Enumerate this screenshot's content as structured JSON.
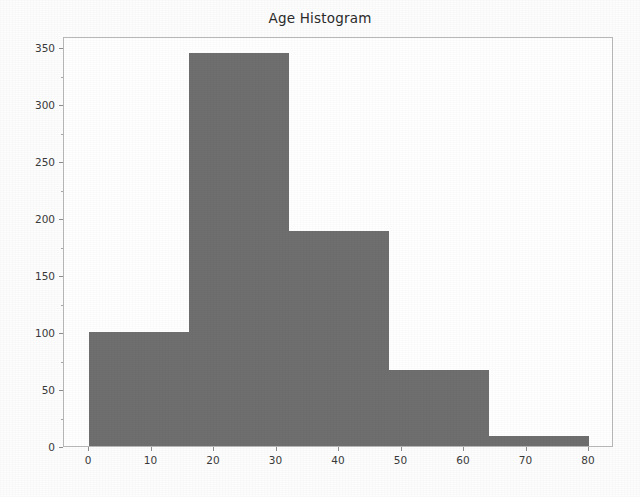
{
  "chart_data": {
    "type": "bar",
    "title": "Age Histogram",
    "xlabel": "",
    "ylabel": "",
    "grid": false,
    "legend": false,
    "bin_edges": [
      0,
      16,
      32,
      48,
      64,
      80
    ],
    "categories": [
      "0-16",
      "16-32",
      "32-48",
      "48-64",
      "64-80"
    ],
    "values": [
      100,
      345,
      189,
      67,
      9
    ],
    "bar_color": "#6f6f6f",
    "xlim": [
      -4,
      84
    ],
    "ylim": [
      0,
      360
    ],
    "xticks": [
      0,
      10,
      20,
      30,
      40,
      50,
      60,
      70,
      80
    ],
    "xtick_labels": [
      "0",
      "10",
      "20",
      "30",
      "40",
      "50",
      "60",
      "70",
      "80"
    ],
    "yticks": [
      0,
      50,
      100,
      150,
      200,
      250,
      300,
      350
    ],
    "ytick_labels": [
      "0",
      "50",
      "100",
      "150",
      "200",
      "250",
      "300",
      "350"
    ],
    "ytick_minor": [
      25,
      75,
      125,
      175,
      225,
      275,
      325
    ],
    "axes_edge_color": "#b9b9b9",
    "background_color": "#ffffff"
  }
}
